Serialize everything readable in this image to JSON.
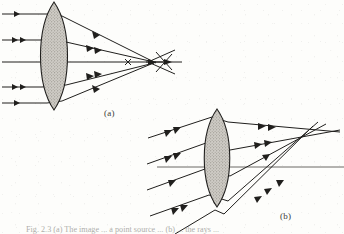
{
  "figure": {
    "kind": "optics-ray-diagram",
    "background_color": "#fdfdfb",
    "ink_color": "#201f1d",
    "lens_fill_color": "#c9c6c0",
    "caption_text": "Fig. 2.3    (a) The image ... a point source ... (b) ... the rays ..."
  },
  "panels": [
    {
      "id": "a",
      "label": "(a)",
      "description": "Parallel rays on axis converging through a biconvex lens to the focal point",
      "lens": {
        "center_x": 54,
        "center_y": 56,
        "half_height": 54,
        "half_width": 14,
        "shape": "biconvex"
      },
      "optical_axis_y": 62,
      "focal_point_x": 152,
      "focal_point_y": 62,
      "incoming_rays_y": [
        14,
        40,
        62,
        87,
        103
      ],
      "cross_marker_x": 128,
      "cross_marker_y": 62
    },
    {
      "id": "b",
      "label": "(b)",
      "description": "Oblique parallel rays converging through a biconvex lens to an off-axis focal point",
      "lens": {
        "center_x": 217,
        "center_y": 158,
        "half_height": 49,
        "half_width": 13,
        "shape": "biconvex"
      },
      "optical_axis_y": 167,
      "focal_point_x": 318,
      "focal_point_y": 139,
      "incoming_ray_angle_deg": -18,
      "incoming_rays_entry_y": [
        114,
        140,
        166,
        192,
        205
      ]
    }
  ],
  "colors": {
    "ink": "#201f1d",
    "lens_fill": "#c9c6c0",
    "paper": "#fdfdfb",
    "caption": "#7d7d79"
  }
}
